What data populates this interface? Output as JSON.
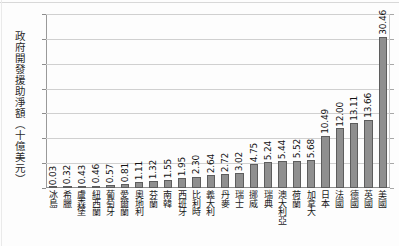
{
  "chart_data": {
    "type": "bar",
    "title": "",
    "xlabel": "",
    "ylabel": "政府開發援助淨額（十億美元）",
    "ylim": [
      0,
      35
    ],
    "yticks": [
      "0",
      "5",
      "10",
      "15",
      "20",
      "25",
      "30",
      "35"
    ],
    "grid": true,
    "legend": "none",
    "orientation": "vertical",
    "bar_color": "#8f8f8f",
    "bar_edge_color": "#5d5d5d",
    "categories": [
      "冰島",
      "希臘",
      "盧森堡",
      "紐西蘭",
      "葡萄牙",
      "愛爾蘭",
      "奧地利",
      "芬蘭",
      "南韓",
      "西班牙",
      "比利時",
      "義大利",
      "丹麥",
      "瑞士",
      "挪威",
      "瑞典",
      "澳大利亞",
      "荷蘭",
      "加拿大",
      "日本",
      "法國",
      "德國",
      "英國",
      "美國"
    ],
    "values": [
      0.03,
      0.32,
      0.43,
      0.46,
      0.57,
      0.81,
      1.11,
      1.32,
      1.55,
      1.95,
      2.3,
      2.64,
      2.72,
      3.02,
      4.75,
      5.24,
      5.44,
      5.52,
      5.68,
      10.49,
      12.0,
      13.11,
      13.66,
      30.46
    ],
    "value_labels": [
      "0.03",
      "0.32",
      "0.43",
      "0.46",
      "0.57",
      "0.81",
      "1.11",
      "1.32",
      "1.55",
      "1.95",
      "2.30",
      "2.64",
      "2.72",
      "3.02",
      "4.75",
      "5.24",
      "5.44",
      "5.52",
      "5.68",
      "10.49",
      "12.00",
      "13.11",
      "13.66",
      "30.46"
    ]
  }
}
